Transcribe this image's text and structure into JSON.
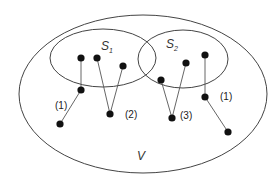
{
  "diagram": {
    "colors": {
      "stroke": "#444444",
      "dot": "#111111",
      "background": "#ffffff"
    },
    "sets": [
      {
        "name": "V",
        "label": "V",
        "sub": "",
        "cx": 143,
        "cy": 94,
        "rx": 124,
        "ry": 79
      },
      {
        "name": "S1",
        "label": "S",
        "sub": "1",
        "cx": 103,
        "cy": 58,
        "rx": 53,
        "ry": 29
      },
      {
        "name": "S2",
        "label": "S",
        "sub": "2",
        "cx": 183,
        "cy": 59,
        "rx": 45,
        "ry": 29
      }
    ],
    "labels": {
      "S1": {
        "text": "S",
        "sub": "1"
      },
      "S2": {
        "text": "S",
        "sub": "2"
      },
      "V": {
        "text": "V"
      }
    },
    "components": [
      {
        "label": "(1)",
        "nodes": [
          [
            81,
            58
          ],
          [
            81,
            90
          ],
          [
            60,
            124
          ]
        ],
        "edges": [
          [
            0,
            1
          ],
          [
            1,
            2
          ]
        ]
      },
      {
        "label": "(2)",
        "nodes": [
          [
            97,
            58
          ],
          [
            123,
            66
          ],
          [
            110,
            114
          ]
        ],
        "edges": [
          [
            0,
            2
          ],
          [
            1,
            2
          ]
        ]
      },
      {
        "label": "(3)",
        "nodes": [
          [
            161,
            80
          ],
          [
            186,
            63
          ],
          [
            172,
            118
          ]
        ],
        "edges": [
          [
            0,
            2
          ],
          [
            1,
            2
          ]
        ]
      },
      {
        "label": "(1)",
        "nodes": [
          [
            205,
            55
          ],
          [
            205,
            97
          ],
          [
            228,
            132
          ]
        ],
        "edges": [
          [
            0,
            1
          ],
          [
            1,
            2
          ]
        ]
      }
    ],
    "component_labels": [
      {
        "text": "(1)",
        "x": 55,
        "y": 109
      },
      {
        "text": "(2)",
        "x": 125,
        "y": 118
      },
      {
        "text": "(3)",
        "x": 180,
        "y": 119
      },
      {
        "text": "(1)",
        "x": 220,
        "y": 100
      }
    ]
  }
}
